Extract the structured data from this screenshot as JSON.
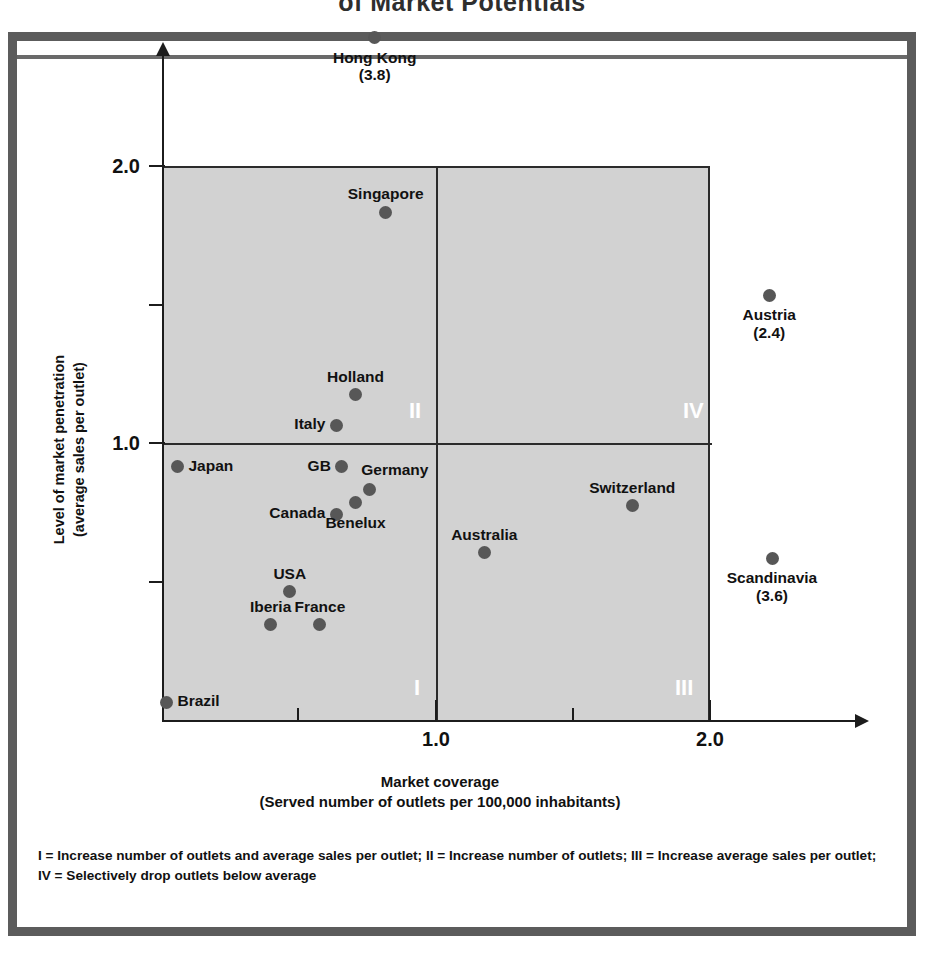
{
  "chart_data": {
    "type": "scatter",
    "title": "of Market Potentials",
    "xlabel": "Market coverage",
    "xlabel_sub": "(Served number of outlets per 100,000 inhabitants)",
    "ylabel": "Level of market penetration",
    "ylabel_sub": "(average sales per outlet)",
    "xlim": [
      0,
      2.2
    ],
    "ylim": [
      0,
      2.2
    ],
    "xticks_major": [
      "1.0",
      "2.0"
    ],
    "xticks_major_values": [
      1.0,
      2.0
    ],
    "xticks_minor_values": [
      0.5,
      1.5
    ],
    "yticks_major": [
      "2.0",
      "1.0"
    ],
    "yticks_major_values": [
      2.0,
      1.0
    ],
    "yticks_minor_values": [
      1.5,
      0.5
    ],
    "grid": false,
    "legend": "none",
    "quadrant_split": {
      "x": 1.0,
      "y": 1.0
    },
    "quadrants": [
      {
        "id": "I",
        "label": "I",
        "position": "bottom-left"
      },
      {
        "id": "II",
        "label": "II",
        "position": "top-left"
      },
      {
        "id": "III",
        "label": "III",
        "position": "bottom-right"
      },
      {
        "id": "IV",
        "label": "IV",
        "position": "top-right"
      }
    ],
    "points": [
      {
        "name": "Hong Kong",
        "x": 0.78,
        "y": 2.46,
        "value": "3.8",
        "label": "Hong Kong",
        "value_label": "(3.8)",
        "label_pos": "below",
        "outside": true
      },
      {
        "name": "Singapore",
        "x": 0.82,
        "y": 1.83,
        "label": "Singapore",
        "label_pos": "above"
      },
      {
        "name": "Austria",
        "x": 2.22,
        "y": 1.53,
        "value": "2.4",
        "label": "Austria",
        "value_label": "(2.4)",
        "label_pos": "below",
        "outside": true
      },
      {
        "name": "Holland",
        "x": 0.71,
        "y": 1.17,
        "label": "Holland",
        "label_pos": "above"
      },
      {
        "name": "Italy",
        "x": 0.64,
        "y": 1.06,
        "label": "Italy",
        "label_pos": "left"
      },
      {
        "name": "Japan",
        "x": 0.06,
        "y": 0.91,
        "label": "Japan",
        "label_pos": "right"
      },
      {
        "name": "GB",
        "x": 0.66,
        "y": 0.91,
        "label": "GB",
        "label_pos": "left"
      },
      {
        "name": "Germany",
        "x": 0.76,
        "y": 0.83,
        "label": "Germany",
        "label_pos": "above-right"
      },
      {
        "name": "Canada",
        "x": 0.64,
        "y": 0.74,
        "label": "Canada",
        "label_pos": "left"
      },
      {
        "name": "Benelux",
        "x": 0.71,
        "y": 0.78,
        "label": "Benelux",
        "label_pos": "below"
      },
      {
        "name": "Switzerland",
        "x": 1.72,
        "y": 0.77,
        "label": "Switzerland",
        "label_pos": "above"
      },
      {
        "name": "Australia",
        "x": 1.18,
        "y": 0.6,
        "label": "Australia",
        "label_pos": "above"
      },
      {
        "name": "Scandinavia",
        "x": 2.23,
        "y": 0.58,
        "value": "3.6",
        "label": "Scandinavia",
        "value_label": "(3.6)",
        "label_pos": "below",
        "outside": true
      },
      {
        "name": "USA",
        "x": 0.47,
        "y": 0.46,
        "label": "USA",
        "label_pos": "above"
      },
      {
        "name": "Iberia",
        "x": 0.4,
        "y": 0.34,
        "label": "Iberia",
        "label_pos": "above"
      },
      {
        "name": "France",
        "x": 0.58,
        "y": 0.34,
        "label": "France",
        "label_pos": "above"
      },
      {
        "name": "Brazil",
        "x": 0.02,
        "y": 0.06,
        "label": "Brazil",
        "label_pos": "right"
      }
    ],
    "footnote": "I = Increase number of outlets and average sales per outlet; II = Increase number of outlets; III = Increase average sales per outlet; IV = Selectively drop outlets below average",
    "colors": {
      "plot_background": "#d2d2d2",
      "point": "#575757",
      "axis": "#1c1c1c",
      "frame": "#5c5c5c",
      "quadrant_label": "#ffffff"
    }
  }
}
